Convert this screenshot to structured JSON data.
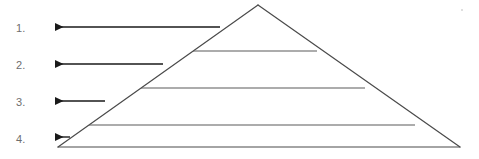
{
  "canvas": {
    "width": 479,
    "height": 159,
    "background": "#ffffff"
  },
  "colors": {
    "pyramid_stroke": "#4a4a4a",
    "divider_stroke": "#5a5a5a",
    "arrow": "#1a1a1a",
    "label_text": "#6e6e6e",
    "speck": "#d8d8d8"
  },
  "diagram": {
    "type": "pyramid",
    "title": "",
    "tier_count": 4,
    "apex": {
      "x": 258,
      "y": 5
    },
    "base_left": {
      "x": 58,
      "y": 147
    },
    "base_right": {
      "x": 460,
      "y": 147
    },
    "tiers": [
      {
        "number_label": "1.",
        "tier_index": 1,
        "text": "",
        "divider_y": 51,
        "divider_x_start": 193,
        "divider_x_end": 317,
        "arrow": {
          "x_tail": 220,
          "x_head": 53,
          "y": 27,
          "length": 167
        }
      },
      {
        "number_label": "2.",
        "tier_index": 2,
        "text": "",
        "divider_y": 88,
        "divider_x_start": 141,
        "divider_x_end": 365,
        "arrow": {
          "x_tail": 163,
          "x_head": 53,
          "y": 64,
          "length": 110
        }
      },
      {
        "number_label": "3.",
        "tier_index": 3,
        "text": "",
        "divider_y": 125,
        "divider_x_start": 89,
        "divider_x_end": 415,
        "arrow": {
          "x_tail": 105,
          "x_head": 53,
          "y": 101,
          "length": 52
        }
      },
      {
        "number_label": "4.",
        "tier_index": 4,
        "text": "",
        "divider_y": 147,
        "divider_x_start": 58,
        "divider_x_end": 460,
        "arrow": {
          "x_tail": 70,
          "x_head": 53,
          "y": 137,
          "length": 17
        }
      }
    ]
  },
  "labels": {
    "one": "1.",
    "two": "2.",
    "three": "3.",
    "four": "4."
  },
  "icons": {
    "arrow_left": "arrow-left-icon",
    "pyramid": "pyramid-icon"
  }
}
